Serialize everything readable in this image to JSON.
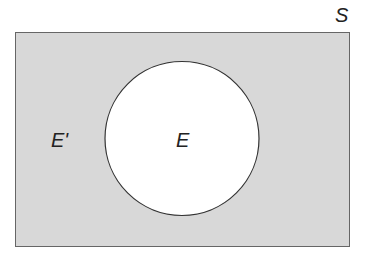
{
  "diagram": {
    "type": "venn",
    "universal_set_label": "S",
    "event_label": "E",
    "complement_label": "E'",
    "colors": {
      "complement_fill": "#d8d8d8",
      "event_fill": "#ffffff",
      "outline": "#444444"
    }
  }
}
